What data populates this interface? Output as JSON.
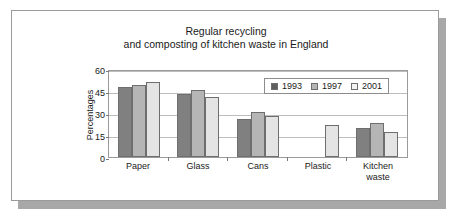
{
  "card": {
    "title": "Regular recycling\nand composting of kitchen waste in England"
  },
  "legend": {
    "items": [
      {
        "label": "1993",
        "color": "#808080",
        "swatch": "legend-swatch-1993"
      },
      {
        "label": "1997",
        "color": "#b5b5b5",
        "swatch": "legend-swatch-1997"
      },
      {
        "label": "2001",
        "color": "#e4e4e4",
        "swatch": "legend-swatch-2001"
      }
    ]
  },
  "axes": {
    "ylabel": "Percentages",
    "yticks": [
      "0",
      "15",
      "30",
      "45",
      "60"
    ],
    "xticks": [
      "Paper",
      "Glass",
      "Cans",
      "Plastic",
      "Kitchen\nwaste"
    ]
  },
  "chart_data": {
    "type": "bar",
    "title": "Regular recycling and composting of kitchen waste in England",
    "xlabel": "",
    "ylabel": "Percentages",
    "ylim": [
      0,
      60
    ],
    "yticks": [
      0,
      15,
      30,
      45,
      60
    ],
    "grid": true,
    "legend_position": "top-right-inside",
    "categories": [
      "Paper",
      "Glass",
      "Cans",
      "Plastic",
      "Kitchen waste"
    ],
    "series": [
      {
        "name": "1993",
        "color": "#808080",
        "values": [
          48,
          43,
          26,
          null,
          20
        ]
      },
      {
        "name": "1997",
        "color": "#b5b5b5",
        "values": [
          49,
          46,
          31,
          null,
          23
        ]
      },
      {
        "name": "2001",
        "color": "#e4e4e4",
        "values": [
          51,
          41,
          28,
          22,
          17
        ]
      }
    ]
  }
}
